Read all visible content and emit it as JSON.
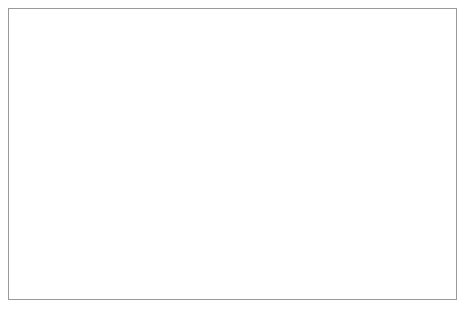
{
  "chart_data": {
    "type": "line",
    "title": "",
    "xlabel": "max_depth",
    "ylabel": "RMSE (lower is better)",
    "x": [
      1,
      2,
      3,
      4,
      5,
      6,
      7,
      8,
      9,
      10,
      11,
      12,
      13,
      14,
      15,
      16,
      17,
      18,
      19,
      20
    ],
    "values": [
      379,
      340,
      365,
      390,
      414.5,
      411.5,
      425.5,
      422,
      441.5,
      438.5,
      436,
      434.5,
      433.5,
      427,
      427.5,
      428,
      432.5,
      432.5,
      432.5,
      432.5
    ],
    "series": [
      {
        "name": "RMSE",
        "values": [
          379,
          340,
          365,
          390,
          414.5,
          411.5,
          425.5,
          422,
          441.5,
          438.5,
          436,
          434.5,
          433.5,
          427,
          427.5,
          428,
          432.5,
          432.5,
          432.5,
          432.5
        ]
      }
    ],
    "xlim": [
      0,
      20.6
    ],
    "ylim": [
      335,
      460
    ],
    "xticks": [
      0,
      5,
      10,
      15,
      20
    ],
    "yticks": [
      340,
      360,
      380,
      400,
      420,
      440,
      460
    ],
    "xtick_labels": [
      "0",
      "5",
      "10",
      "15",
      "20"
    ],
    "ytick_labels": [
      "340",
      "360",
      "380",
      "400",
      "420",
      "440",
      "460"
    ],
    "grid": true,
    "grid_color": "#ffffff",
    "plot_background": "#e0e0e0",
    "line_color": "#5a5a5a",
    "legend": null,
    "legend_position": "none"
  }
}
